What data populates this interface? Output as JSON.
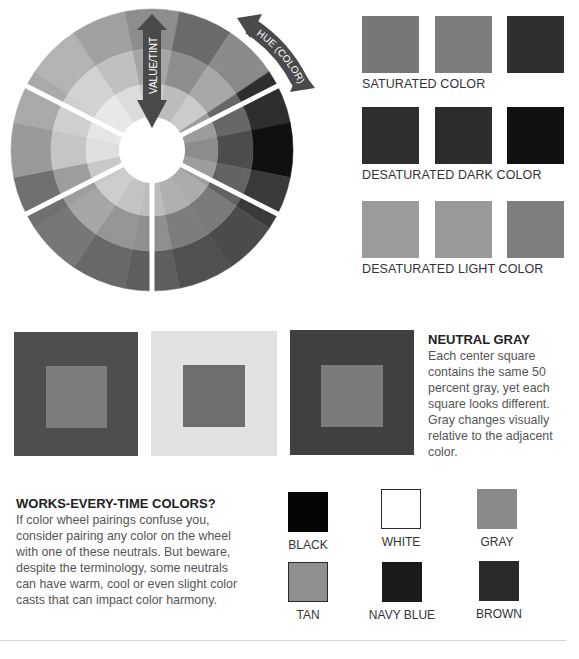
{
  "color_wheel": {
    "value_arrow_label": "VALUE/TINT",
    "hue_arrow_label": "HUE (COLOR)",
    "arrow_color": "#4a4a4a",
    "rings": [
      [
        "#8d8d8d",
        "#6a6a6a",
        "#8a8a8a",
        "#2e2e2e",
        "#101010",
        "#3a3a3a",
        "#4b4b4b",
        "#505050",
        "#5e5e5e",
        "#686868",
        "#777777",
        "#707070",
        "#9a9a9a",
        "#a9a9a9",
        "#b3b3b3",
        "#a0a0a0"
      ],
      [
        "#a5a5a5",
        "#8e8e8e",
        "#a8a8a8",
        "#676767",
        "#4d4d4d",
        "#636363",
        "#7a7a7a",
        "#7d7d7d",
        "#8f8f8f",
        "#959595",
        "#a6a6a6",
        "#9d9d9d",
        "#c5c5c5",
        "#cfcfcf",
        "#d2d2d2",
        "#c0c0c0"
      ],
      [
        "#c8c8c8",
        "#bcbcbc",
        "#cbcbcb",
        "#9c9c9c",
        "#8c8c8c",
        "#9d9d9d",
        "#acacac",
        "#b0b0b0",
        "#bdbdbd",
        "#c3c3c3",
        "#cdcdcd",
        "#c8c8c8",
        "#e0e0e0",
        "#e6e6e6",
        "#e8e8e8",
        "#dcdcdc"
      ]
    ]
  },
  "swatch_groups": [
    {
      "label": "SATURATED COLOR",
      "colors": [
        "#777777",
        "#7d7d7d",
        "#2f2f2f"
      ]
    },
    {
      "label": "DESATURATED DARK COLOR",
      "colors": [
        "#2e2e2e",
        "#2c2c2c",
        "#111111"
      ]
    },
    {
      "label": "DESATURATED LIGHT COLOR",
      "colors": [
        "#9b9b9b",
        "#9a9a9a",
        "#7e7e7e"
      ]
    }
  ],
  "neutral_gray_demo": {
    "heading": "NEUTRAL GRAY",
    "body": "Each center square contains the same 50 percent gray, yet each square looks different. Gray changes visually relative to the adjacent color.",
    "squares": [
      {
        "outer": "#4e4e4e",
        "inner": "#7c7c7c"
      },
      {
        "outer": "#e2e2e2",
        "inner": "#6e6e6e"
      },
      {
        "outer": "#404040",
        "inner": "#7a7a7a"
      }
    ]
  },
  "works_every_time": {
    "heading": "WORKS-EVERY-TIME COLORS?",
    "body": "If color wheel pairings confuse you, consider pairing any color on the wheel with one of these neutrals. But beware, despite the terminology, some neutrals can have warm, cool or even slight color casts that can impact color harmony.",
    "neutrals": [
      {
        "label": "BLACK",
        "color": "#050505",
        "border": "#050505"
      },
      {
        "label": "WHITE",
        "color": "#ffffff",
        "border": "#2a2a2a"
      },
      {
        "label": "GRAY",
        "color": "#8a8a8a",
        "border": "#8a8a8a"
      },
      {
        "label": "TAN",
        "color": "#8f8f8f",
        "border": "#2a2a2a"
      },
      {
        "label": "NAVY BLUE",
        "color": "#1a1a1a",
        "border": "#1a1a1a"
      },
      {
        "label": "BROWN",
        "color": "#2a2a2a",
        "border": "#2a2a2a"
      }
    ]
  }
}
